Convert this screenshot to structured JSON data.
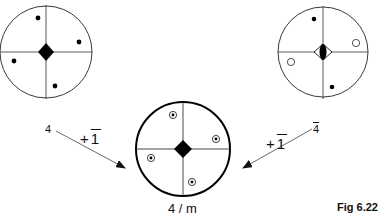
{
  "diagram": {
    "stereograms": [
      {
        "id": "left",
        "symmetry_label": "4",
        "center_symbol": "filled-diamond (4-fold axis)",
        "poles": "4 filled dots (upper hemisphere)"
      },
      {
        "id": "right",
        "symmetry_label": "4̄",
        "center_symbol": "diamond with inscribed lens (4̄ inversion axis)",
        "poles": "2 filled dots, 2 open circles"
      },
      {
        "id": "bottom",
        "symmetry_label": "4 / m",
        "center_symbol": "filled-diamond",
        "poles": "4 dot-in-circle (both hemispheres)"
      }
    ],
    "labels": {
      "left_group": "4",
      "right_group": "4",
      "left_op_plus": "+",
      "left_op": "1",
      "right_op_plus": "+",
      "right_op": "1",
      "result": "4 / m",
      "figure": "Fig 6.22"
    },
    "colors": {
      "ink": "#111111",
      "background": "#ffffff"
    }
  }
}
